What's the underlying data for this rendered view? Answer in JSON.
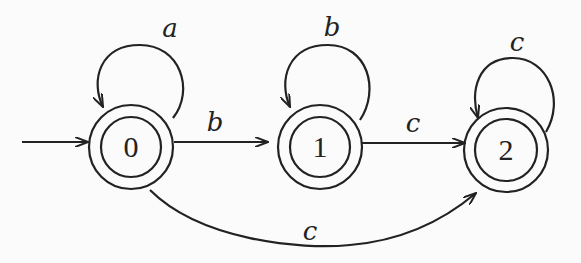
{
  "diagram": {
    "type": "finite-state-automaton",
    "start_state": "0",
    "states": [
      {
        "id": "0",
        "label": "0",
        "accepting": true
      },
      {
        "id": "1",
        "label": "1",
        "accepting": true
      },
      {
        "id": "2",
        "label": "2",
        "accepting": true
      }
    ],
    "transitions": [
      {
        "from": "0",
        "to": "0",
        "label": "a"
      },
      {
        "from": "0",
        "to": "1",
        "label": "b"
      },
      {
        "from": "1",
        "to": "1",
        "label": "b"
      },
      {
        "from": "1",
        "to": "2",
        "label": "c"
      },
      {
        "from": "2",
        "to": "2",
        "label": "c"
      },
      {
        "from": "0",
        "to": "2",
        "label": "c"
      }
    ]
  }
}
